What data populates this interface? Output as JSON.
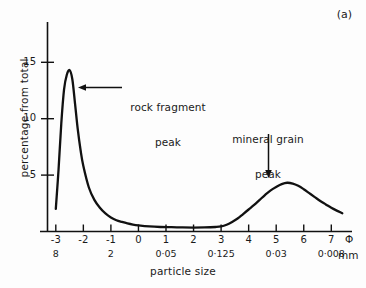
{
  "figure": {
    "panel_label": "(a)",
    "background_color": "#fdfdfd",
    "line_color": "#111111"
  },
  "axes": {
    "y_title": "percentage from total",
    "x_title": "particle size",
    "phi_unit_symbol": "Φ",
    "mm_unit_label": "mm",
    "y_ticks": [
      5,
      10,
      15
    ],
    "y_tick_labels": [
      "5",
      "10",
      "15"
    ],
    "x_ticks": [
      -3,
      -2,
      -1,
      0,
      1,
      2,
      3,
      4,
      5,
      6,
      7
    ],
    "x_tick_labels": [
      "-3",
      "-2",
      "-1",
      "0",
      "1",
      "2",
      "3",
      "4",
      "5",
      "6",
      "7"
    ],
    "mm_ticks": [
      -3,
      -1,
      1,
      3,
      5,
      7
    ],
    "mm_tick_labels": [
      "8",
      "2",
      "0·05",
      "0·125",
      "0·03",
      "0·008"
    ]
  },
  "annotations": [
    {
      "name": "rock-fragment-peak",
      "line1": "rock fragment",
      "line2": "peak",
      "arrow": "left"
    },
    {
      "name": "mineral-grain-peak",
      "line1": "mineral grain",
      "line2": "peak",
      "arrow": "down"
    }
  ],
  "chart_data": {
    "type": "line",
    "title": "",
    "subtitle": "",
    "xlabel": "particle size",
    "ylabel": "percentage from total",
    "xlim": [
      -3.3,
      7.8
    ],
    "ylim": [
      0,
      16.5
    ],
    "grid": false,
    "legend": null,
    "x_axis_secondary": {
      "label": "mm",
      "ticks": [
        -3,
        -1,
        1,
        3,
        5,
        7
      ],
      "tick_labels": [
        "8",
        "2",
        "0·5",
        "0·125",
        "0·03",
        "0·008"
      ]
    },
    "annotations": [
      {
        "text": "rock fragment peak",
        "points_to_phi": -2.35,
        "points_to_value": 11.5
      },
      {
        "text": "mineral grain peak",
        "points_to_phi": 5.4,
        "points_to_value": 4.3
      }
    ],
    "series": [
      {
        "name": "grain size distribution",
        "x": [
          -3.0,
          -2.9,
          -2.8,
          -2.7,
          -2.6,
          -2.5,
          -2.4,
          -2.3,
          -2.2,
          -2.1,
          -2.0,
          -1.8,
          -1.6,
          -1.4,
          -1.2,
          -1.0,
          -0.8,
          -0.6,
          -0.4,
          -0.2,
          0.0,
          0.4,
          0.8,
          1.2,
          1.6,
          2.0,
          2.4,
          2.8,
          3.0,
          3.2,
          3.4,
          3.6,
          3.8,
          4.0,
          4.2,
          4.4,
          4.6,
          4.8,
          5.0,
          5.2,
          5.4,
          5.6,
          5.8,
          6.0,
          6.2,
          6.4,
          6.6,
          6.8,
          7.0,
          7.2,
          7.4
        ],
        "y": [
          2.0,
          5.5,
          9.6,
          12.6,
          13.9,
          14.3,
          13.5,
          11.3,
          9.0,
          7.2,
          5.8,
          3.9,
          2.8,
          2.1,
          1.6,
          1.25,
          1.0,
          0.85,
          0.72,
          0.62,
          0.55,
          0.45,
          0.4,
          0.38,
          0.36,
          0.35,
          0.36,
          0.4,
          0.45,
          0.6,
          0.85,
          1.15,
          1.55,
          1.95,
          2.35,
          2.8,
          3.25,
          3.65,
          3.95,
          4.2,
          4.32,
          4.25,
          4.05,
          3.75,
          3.4,
          3.05,
          2.7,
          2.4,
          2.1,
          1.85,
          1.62
        ]
      }
    ]
  }
}
